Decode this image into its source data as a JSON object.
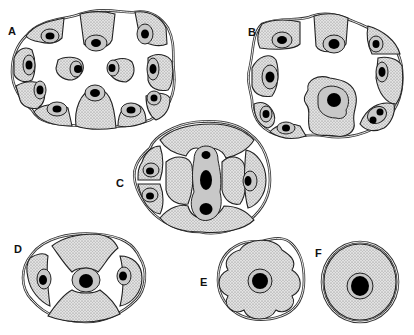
{
  "figure": {
    "title_fragment": "…s appear…",
    "panels": [
      {
        "id": "A",
        "label": "A",
        "description": "Oval cross-section with ~10 peripheral stippled cells each with a haloed nucleus, plus 2 free inner cells; white central space"
      },
      {
        "id": "B",
        "label": "B",
        "description": "Rounded cross-section with peripheral stippled cells and a large central lobed cell with a prominent nucleus"
      },
      {
        "id": "C",
        "label": "C",
        "description": "Oval cross-section; central elongated cell with three nuclei (small top, large oval middle, bottom), lateral cells with nuclei"
      },
      {
        "id": "D",
        "label": "D",
        "description": "Oval cross-section with central cell and nucleus flanked by two white crescent spaces and two lateral cells"
      },
      {
        "id": "E",
        "label": "E",
        "description": "Four-lobed rounded cross-section with central haloed nucleus"
      },
      {
        "id": "F",
        "label": "F",
        "description": "Circular cross-section with single central haloed nucleus"
      }
    ]
  },
  "colors": {
    "cytoplasm": "#d9d9d9",
    "halo": "#c8c8c8",
    "nucleus": "#000000",
    "outline": "#222222",
    "background": "#ffffff"
  }
}
